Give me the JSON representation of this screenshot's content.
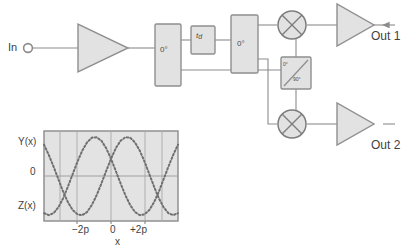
{
  "diagram": {
    "input": {
      "label": "In",
      "terminal_icon": "open-circle-terminal"
    },
    "outputs": [
      {
        "id": "out1",
        "label": "Out 1"
      },
      {
        "id": "out2",
        "label": "Out 2"
      }
    ],
    "blocks": [
      {
        "id": "amp-input",
        "type": "amplifier",
        "icon": "triangle-amplifier-icon",
        "label": ""
      },
      {
        "id": "splitter-1",
        "type": "power-splitter",
        "label": "0°"
      },
      {
        "id": "delay",
        "type": "delay-line",
        "label": "t",
        "sublabel": "d"
      },
      {
        "id": "splitter-2",
        "type": "power-splitter",
        "label": "0°"
      },
      {
        "id": "quad-hybrid",
        "type": "quadrature-hybrid",
        "label_top": "0°",
        "label_bottom": "90°"
      },
      {
        "id": "mixer-1",
        "type": "mixer",
        "icon": "circle-x-mixer-icon"
      },
      {
        "id": "mixer-2",
        "type": "mixer",
        "icon": "circle-x-mixer-icon"
      },
      {
        "id": "amp-out1",
        "type": "amplifier",
        "icon": "triangle-amplifier-icon"
      },
      {
        "id": "amp-out2",
        "type": "amplifier",
        "icon": "triangle-amplifier-icon"
      }
    ],
    "colors": {
      "line": "#8c8c8c",
      "block_fill": "#e2e2e2",
      "block_stroke": "#8f8f8f",
      "text": "#3f3f3f",
      "plot_bg": "#e3e3e3",
      "curve": "#6f6f6f"
    }
  },
  "chart_data": {
    "type": "line",
    "title": "",
    "xlabel": "x",
    "ylabel": "",
    "x_tick_labels": [
      "−2p",
      "0",
      "+2p"
    ],
    "x_tick_values": [
      -2,
      0,
      2
    ],
    "y_tick_labels": [
      "Y(x)",
      "0",
      "Z(x)"
    ],
    "y_tick_values": [
      1,
      0,
      -1
    ],
    "xlim": [
      -4.2,
      4.2
    ],
    "ylim": [
      -1.15,
      1.15
    ],
    "grid": true,
    "legend": "none",
    "series": [
      {
        "name": "Y(x)",
        "style": "dotted",
        "x": [
          -4.2,
          -3.9,
          -3.6,
          -3.3,
          -3.0,
          -2.7,
          -2.4,
          -2.1,
          -1.8,
          -1.5,
          -1.2,
          -0.9,
          -0.6,
          -0.3,
          0.0,
          0.3,
          0.6,
          0.9,
          1.2,
          1.5,
          1.8,
          2.1,
          2.4,
          2.7,
          3.0,
          3.3,
          3.6,
          3.9,
          4.2
        ],
        "y": [
          0.8,
          0.54,
          0.24,
          -0.08,
          -0.4,
          -0.67,
          -0.87,
          -0.98,
          -1.0,
          -0.92,
          -0.74,
          -0.49,
          -0.19,
          0.13,
          0.44,
          0.71,
          0.9,
          0.99,
          0.98,
          0.86,
          0.65,
          0.37,
          0.05,
          -0.27,
          -0.57,
          -0.8,
          -0.95,
          -1.0,
          -0.95
        ]
      },
      {
        "name": "Z(x)",
        "style": "dotted",
        "x": [
          -4.2,
          -3.9,
          -3.6,
          -3.3,
          -3.0,
          -2.7,
          -2.4,
          -2.1,
          -1.8,
          -1.5,
          -1.2,
          -0.9,
          -0.6,
          -0.3,
          0.0,
          0.3,
          0.6,
          0.9,
          1.2,
          1.5,
          1.8,
          2.1,
          2.4,
          2.7,
          3.0,
          3.3,
          3.6,
          3.9,
          4.2
        ],
        "y": [
          -0.95,
          -1.0,
          -0.95,
          -0.8,
          -0.57,
          -0.27,
          0.05,
          0.37,
          0.65,
          0.86,
          0.98,
          0.99,
          0.9,
          0.71,
          0.44,
          0.13,
          -0.19,
          -0.49,
          -0.74,
          -0.92,
          -1.0,
          -0.98,
          -0.87,
          -0.67,
          -0.4,
          -0.08,
          0.24,
          0.54,
          0.8
        ]
      }
    ]
  }
}
